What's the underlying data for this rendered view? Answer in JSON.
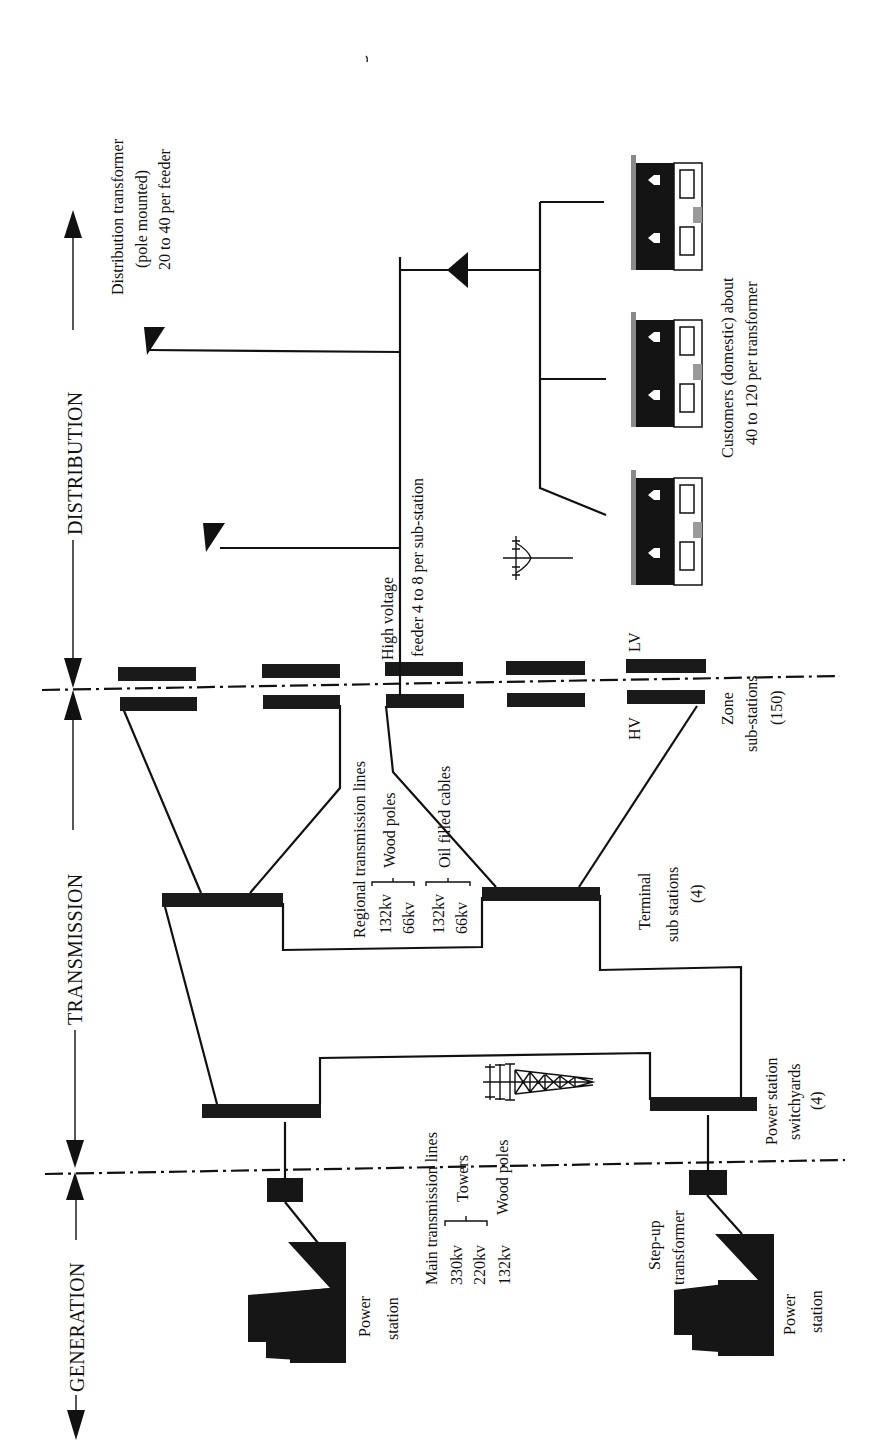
{
  "sections": {
    "generation": "GENERATION",
    "transmission": "TRANSMISSION",
    "distribution": "DISTRIBUTION"
  },
  "labels": {
    "power_station_1": [
      "Power",
      "station"
    ],
    "power_station_2": [
      "Power",
      "station"
    ],
    "step_up_transformer": [
      "Step-up",
      "transformer"
    ],
    "main_transmission_lines": {
      "title": "Main transmission lines",
      "v330": "330kv",
      "v220": "220kv",
      "v132": "132kv",
      "towers": "Towers",
      "wood_poles": "Wood poles"
    },
    "power_station_switchyards": [
      "Power station",
      "switchyards",
      "(4)"
    ],
    "regional_transmission_lines": {
      "title": "Regional transmission lines",
      "a_132": "132kv",
      "a_66": "66kv",
      "wood_poles": "Wood poles",
      "b_132": "132kv",
      "b_66": "66kv",
      "oil_filled_cables": "Oil filled cables"
    },
    "terminal_sub_stations": [
      "Terminal",
      "sub stations",
      "(4)"
    ],
    "zone_sub_stations": [
      "Zone",
      "sub-stations",
      "(150)"
    ],
    "hv": "HV",
    "lv": "LV",
    "high_voltage_feeder": [
      "High voltage",
      "feeder 4 to 8 per sub-station"
    ],
    "distribution_transformer": [
      "Distribution transformer",
      "(pole mounted)",
      "20 to 40 per feeder"
    ],
    "customers": [
      "Customers (domestic) about",
      "40 to 120 per transformer"
    ]
  },
  "colors": {
    "ink": "#111111",
    "background": "#ffffff",
    "roof_gray": "#9a9a9a"
  }
}
